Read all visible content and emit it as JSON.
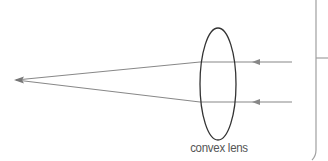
{
  "diagram": {
    "lens": {
      "label": "convex lens",
      "cx": 218,
      "cy": 82,
      "rx": 18,
      "ry": 55
    },
    "rays": [
      {
        "name": "upper-ray",
        "y": 62,
        "start_x": 292,
        "lens_x": 200,
        "focus_x": 15,
        "focus_y": 80
      },
      {
        "name": "lower-ray",
        "y": 102,
        "start_x": 292,
        "lens_x": 200,
        "focus_x": 15,
        "focus_y": 80
      }
    ],
    "focal_point": {
      "x": 15,
      "y": 80
    },
    "colors": {
      "ray": "#888888",
      "lens": "#333333",
      "bracket": "#999999",
      "label": "#555555"
    }
  }
}
